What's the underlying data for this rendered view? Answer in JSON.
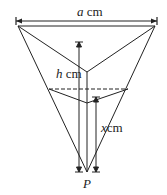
{
  "diagram": {
    "labels": {
      "top_width_var": "a",
      "top_width_unit": " cm",
      "height_var": "h",
      "height_unit": " cm",
      "depth_var": "x",
      "depth_unit": "cm",
      "apex": "P"
    },
    "colors": {
      "stroke": "#222222",
      "background": "#ffffff"
    }
  }
}
